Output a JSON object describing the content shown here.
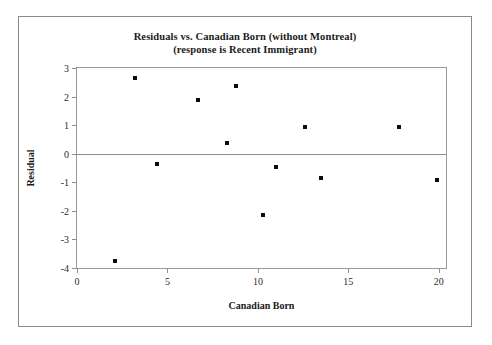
{
  "chart_data": {
    "type": "scatter",
    "title": "Residuals vs. Canadian Born (without Montreal)",
    "subtitle": "(response is Recent Immigrant)",
    "xlabel": "Canadian Born",
    "ylabel": "Residual",
    "xlim": [
      0,
      20.4
    ],
    "ylim": [
      -4,
      3
    ],
    "xticks": [
      0,
      5,
      10,
      15,
      20
    ],
    "yticks": [
      3,
      2,
      1,
      0,
      -1,
      -2,
      -3,
      -4
    ],
    "xtick_labels": [
      "0",
      "5",
      "10",
      "15",
      "20"
    ],
    "ytick_labels": [
      "3",
      "2",
      "1",
      "0",
      "-1",
      "-2",
      "-3",
      "-4"
    ],
    "grid": false,
    "legend": null,
    "reference_line": {
      "axis": "y",
      "value": 0
    },
    "marker": {
      "shape": "square",
      "color": "#0d0d0d",
      "size": 4
    },
    "points": [
      {
        "x": 2.1,
        "y": -3.75
      },
      {
        "x": 3.2,
        "y": 2.65
      },
      {
        "x": 4.4,
        "y": -0.35
      },
      {
        "x": 6.7,
        "y": 1.88
      },
      {
        "x": 8.3,
        "y": 0.38
      },
      {
        "x": 8.8,
        "y": 2.37
      },
      {
        "x": 10.3,
        "y": -2.15
      },
      {
        "x": 11.0,
        "y": -0.45
      },
      {
        "x": 12.6,
        "y": 0.93
      },
      {
        "x": 13.5,
        "y": -0.85
      },
      {
        "x": 17.8,
        "y": 0.93
      },
      {
        "x": 19.9,
        "y": -0.93
      }
    ]
  },
  "colors": {
    "frame": "#8a8a8a",
    "axis": "#9a9a9a",
    "marker": "#0d0d0d",
    "text": "#1a1a1a",
    "background": "#ffffff"
  }
}
